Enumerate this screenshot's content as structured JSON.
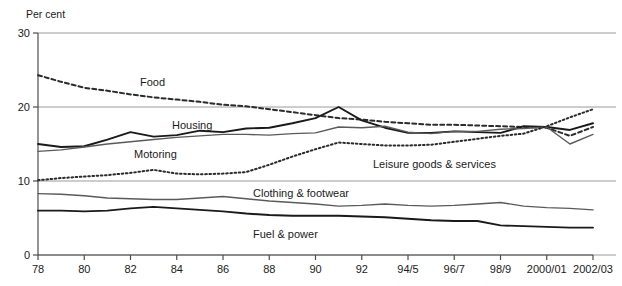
{
  "chart_data": {
    "type": "line",
    "title": "",
    "xlabel": "",
    "ylabel": "Per cent",
    "ylim": [
      0,
      30
    ],
    "yticks": [
      0,
      10,
      20,
      30
    ],
    "ytick_labels": [
      "0",
      "10",
      "20",
      "30"
    ],
    "grid": true,
    "legend_position": "inline-labels",
    "x": [
      1978,
      1979,
      1980,
      1981,
      1982,
      1983,
      1984,
      1985,
      1986,
      1987,
      1988,
      1989,
      1990,
      1991,
      1992,
      1993,
      1994,
      1995,
      1996,
      1997,
      1998,
      1999,
      2000,
      2001,
      2002
    ],
    "xtick_positions": [
      1978,
      1980,
      1982,
      1984,
      1986,
      1988,
      1990,
      1992,
      1994,
      1996,
      1998,
      2000,
      2002
    ],
    "xtick_labels": [
      "78",
      "80",
      "82",
      "84",
      "86",
      "88",
      "90",
      "92",
      "94/5",
      "96/7",
      "98/9",
      "2000/01",
      "2002/03"
    ],
    "series": [
      {
        "name": "Food",
        "style": "dashed",
        "color": "#2b2b2b",
        "label": "Food",
        "values": [
          24.3,
          23.4,
          22.6,
          22.2,
          21.7,
          21.3,
          21.0,
          20.7,
          20.3,
          20.1,
          19.7,
          19.3,
          18.9,
          18.5,
          18.3,
          18.0,
          17.8,
          17.6,
          17.6,
          17.5,
          17.4,
          17.3,
          17.2,
          16.1,
          17.3
        ]
      },
      {
        "name": "Housing",
        "style": "solid-bold",
        "color": "#1a1a1a",
        "label": "Housing",
        "values": [
          15.0,
          14.6,
          14.7,
          15.6,
          16.6,
          16.0,
          16.2,
          16.8,
          16.6,
          17.1,
          17.2,
          17.8,
          18.5,
          20.0,
          18.2,
          17.2,
          16.5,
          16.5,
          16.7,
          16.6,
          16.5,
          17.4,
          17.3,
          16.9,
          17.8
        ]
      },
      {
        "name": "Motoring",
        "style": "solid-grey",
        "color": "#5a5a5a",
        "label": "Motoring",
        "values": [
          14.0,
          14.2,
          14.6,
          15.0,
          15.3,
          15.6,
          15.9,
          16.1,
          16.3,
          16.3,
          16.2,
          16.4,
          16.5,
          17.3,
          17.2,
          17.4,
          16.6,
          16.4,
          16.7,
          16.7,
          17.0,
          17.1,
          17.3,
          15.0,
          16.3
        ]
      },
      {
        "name": "Leisure goods & services",
        "style": "dotted",
        "color": "#2b2b2b",
        "label": "Leisure goods & services",
        "values": [
          10.1,
          10.4,
          10.6,
          10.8,
          11.1,
          11.5,
          11.0,
          10.9,
          11.0,
          11.2,
          12.2,
          13.3,
          14.3,
          15.2,
          15.0,
          14.8,
          14.8,
          14.9,
          15.3,
          15.7,
          16.1,
          16.4,
          17.4,
          18.6,
          19.7
        ]
      },
      {
        "name": "Clothing & footwear",
        "style": "solid-grey",
        "color": "#5a5a5a",
        "label": "Clothing & footwear",
        "values": [
          8.3,
          8.2,
          8.0,
          7.7,
          7.6,
          7.5,
          7.5,
          7.7,
          7.9,
          7.6,
          7.3,
          7.1,
          6.9,
          6.6,
          6.7,
          6.9,
          6.7,
          6.6,
          6.7,
          6.9,
          7.1,
          6.6,
          6.4,
          6.3,
          6.1
        ]
      },
      {
        "name": "Fuel & power",
        "style": "solid-bold",
        "color": "#1a1a1a",
        "label": "Fuel & power",
        "values": [
          6.0,
          6.0,
          5.9,
          6.0,
          6.3,
          6.5,
          6.3,
          6.1,
          5.9,
          5.6,
          5.4,
          5.3,
          5.3,
          5.3,
          5.2,
          5.1,
          4.9,
          4.7,
          4.6,
          4.6,
          4.0,
          3.9,
          3.8,
          3.7,
          3.7
        ]
      }
    ],
    "annotations": [
      {
        "text": "Food",
        "x": 140,
        "y": 86
      },
      {
        "text": "Housing",
        "x": 172,
        "y": 129
      },
      {
        "text": "Motoring",
        "x": 134,
        "y": 158
      },
      {
        "text": "Leisure goods & services",
        "x": 373,
        "y": 168
      },
      {
        "text": "Clothing & footwear",
        "x": 253,
        "y": 197
      },
      {
        "text": "Fuel & power",
        "x": 253,
        "y": 238
      }
    ]
  },
  "axis": {
    "unit_label": "Per cent"
  }
}
